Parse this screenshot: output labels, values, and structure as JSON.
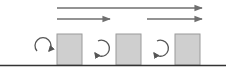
{
  "diagram": {
    "colors": {
      "background": "#ffffff",
      "arrow": "#6f6f6f",
      "box_fill": "#cfcfcf",
      "box_stroke": "#9a9a9a",
      "ground": "#333333",
      "rotation_arrow": "#555555"
    },
    "top_arrows": [
      {
        "row": 1,
        "x1": 57,
        "x2": 202,
        "y": 8
      },
      {
        "row": 2,
        "x1": 57,
        "x2": 110,
        "y": 19
      },
      {
        "row": 2,
        "x1": 147,
        "x2": 202,
        "y": 19
      }
    ],
    "boxes": [
      {
        "x": 57,
        "y": 34,
        "w": 25,
        "h": 31
      },
      {
        "x": 116,
        "y": 34,
        "w": 25,
        "h": 31
      },
      {
        "x": 175,
        "y": 34,
        "w": 25,
        "h": 31
      }
    ],
    "rotation_arrows": [
      {
        "cx": 42,
        "cy": 44,
        "direction": "clockwise"
      },
      {
        "cx": 101,
        "cy": 48,
        "direction": "counter-clockwise"
      },
      {
        "cx": 160,
        "cy": 48,
        "direction": "counter-clockwise"
      }
    ],
    "ground_line": {
      "x1": 0,
      "x2": 226,
      "y": 65
    }
  }
}
